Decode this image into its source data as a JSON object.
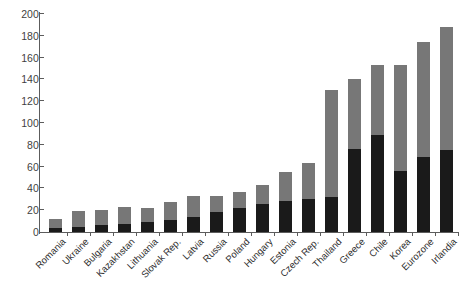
{
  "chart_data": {
    "type": "bar",
    "subtype": "stacked-column",
    "title": "",
    "subtitle": "",
    "xlabel": "",
    "ylabel": "",
    "ylim": [
      0,
      200
    ],
    "yticks": [
      0,
      20,
      40,
      60,
      80,
      100,
      120,
      140,
      160,
      180,
      200
    ],
    "grid": false,
    "legend": "none",
    "categories": [
      "Romania",
      "Ukraine",
      "Bulgaria",
      "Kazakhstan",
      "Lithuania",
      "Slovak Rep.",
      "Latvia",
      "Russia",
      "Poland",
      "Hungary",
      "Estonia",
      "Czech Rep.",
      "Thailand",
      "Greece",
      "Chile",
      "Korea",
      "Eurozone",
      "Irlandia"
    ],
    "series": [
      {
        "name": "lower-segment",
        "color": "#1a1a1a",
        "values": [
          4,
          5,
          6,
          7,
          9,
          11,
          14,
          18,
          22,
          26,
          28,
          30,
          32,
          76,
          89,
          56,
          69,
          75
        ]
      },
      {
        "name": "upper-segment",
        "color": "#777777",
        "values": [
          8,
          14,
          14,
          16,
          13,
          17,
          19,
          15,
          15,
          17,
          27,
          33,
          98,
          64,
          64,
          97,
          105,
          113
        ]
      }
    ],
    "totals": [
      12,
      19,
      20,
      23,
      22,
      28,
      33,
      33,
      37,
      43,
      55,
      63,
      130,
      140,
      153,
      153,
      174,
      188
    ]
  },
  "axis": {
    "y_min_label": "0",
    "y_max_label": "200"
  }
}
